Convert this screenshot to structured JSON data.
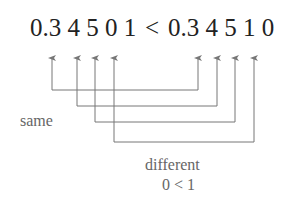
{
  "diagram": {
    "left_number": "0.3 4 5 0 1",
    "operator": "<",
    "right_number": "0.3 4 5 1 0",
    "label_same": "same",
    "label_different": "different",
    "label_reason": "0 < 1",
    "colors": {
      "text": "#222222",
      "lines": "#777777",
      "labels": "#666666"
    }
  }
}
